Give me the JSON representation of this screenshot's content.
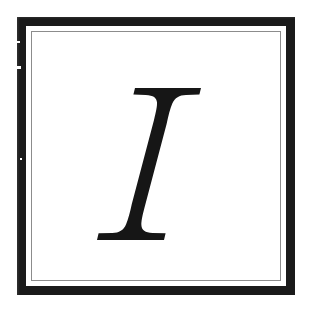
{
  "page": {
    "width": 316,
    "height": 312,
    "background_color": "#ffffff"
  },
  "frame": {
    "name": "double-rule-border",
    "outer_band_color": "#1a1a1a",
    "outer_band_thickness_px": 9,
    "inner_rule_color": "#8c8c8c",
    "inner_rule_thickness_px": 1,
    "field_color": "#ffffff"
  },
  "artifacts": {
    "description": "small white nicks along the left black band from the scan",
    "count": 3
  },
  "letter": {
    "character": "I",
    "name": "drop-cap-letter-i",
    "style": "bold italic serif",
    "color": "#161616",
    "bounds": {
      "x": 113,
      "y": 88,
      "width": 84,
      "height": 134
    },
    "serif_style": "heavy slab with concave bracket flares",
    "slant": "italic, stem leans right"
  }
}
